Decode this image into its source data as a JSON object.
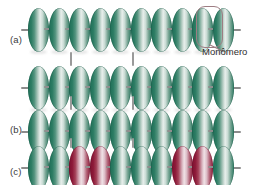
{
  "figure": {
    "background_color": "#ffffff",
    "width": 269,
    "height": 185
  },
  "colors": {
    "monomer_green_dark": "#1f6e57",
    "monomer_green_light": "#e8efec",
    "monomer_red_dark": "#7d1030",
    "monomer_red_light": "#f0e2e6",
    "axis_gray": "#8c8c8c",
    "callout_outline": "#9d7d83",
    "label_text": "#3a3a3a"
  },
  "rows": [
    {
      "id": "row-a",
      "label": "(a)",
      "label_x": 10,
      "label_y": 34,
      "chain_x": 28,
      "chain_y": 8,
      "monomer_count": 10,
      "monomer_colors": [
        "green",
        "green",
        "green",
        "green",
        "green",
        "green",
        "green",
        "green",
        "green",
        "green"
      ]
    },
    {
      "id": "row-b-upper",
      "label": "",
      "label_x": 0,
      "label_y": 0,
      "chain_x": 28,
      "chain_y": 66,
      "monomer_count": 10,
      "monomer_colors": [
        "green",
        "green",
        "green",
        "green",
        "green",
        "green",
        "green",
        "green",
        "green",
        "green"
      ]
    },
    {
      "id": "row-b",
      "label": "(b)",
      "label_x": 10,
      "label_y": 124,
      "chain_x": 28,
      "chain_y": 110,
      "monomer_count": 10,
      "monomer_colors": [
        "green",
        "green",
        "green",
        "green",
        "green",
        "green",
        "green",
        "green",
        "green",
        "green"
      ]
    },
    {
      "id": "row-c",
      "label": "(c)",
      "label_x": 10,
      "label_y": 168,
      "chain_x": 28,
      "chain_y": 146,
      "monomer_count": 10,
      "monomer_colors": [
        "green",
        "green",
        "red",
        "red",
        "green",
        "green",
        "green",
        "red",
        "red",
        "green"
      ]
    }
  ],
  "ticks": [
    {
      "x": 70,
      "y": 52,
      "height": 14
    },
    {
      "x": 132,
      "y": 52,
      "height": 14
    },
    {
      "x": 70,
      "y": 96,
      "height": 14
    },
    {
      "x": 132,
      "y": 96,
      "height": 14
    },
    {
      "x": 70,
      "y": 138,
      "height": 10
    },
    {
      "x": 132,
      "y": 138,
      "height": 10
    }
  ],
  "callout": {
    "label": "Monômero",
    "label_x": 200,
    "label_y": 41,
    "box_x": 196,
    "box_y": 6,
    "box_width": 25,
    "box_height": 40,
    "leader_x": 196,
    "leader_y": 40,
    "leader_length": 14,
    "leader_angle": 28
  }
}
